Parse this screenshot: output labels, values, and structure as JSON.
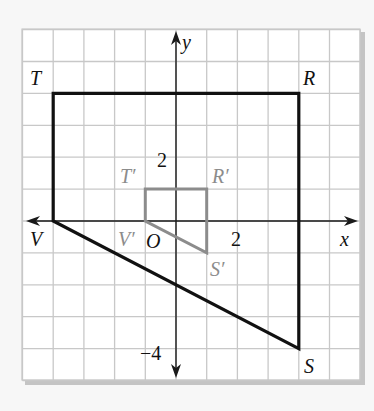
{
  "diagram": {
    "type": "coordinate-plane-dilation",
    "grid": {
      "x_min": -5,
      "x_max": 6,
      "y_min": -5,
      "y_max": 6,
      "origin_px": [
        176,
        221
      ],
      "cell_w": 30.7,
      "cell_h": 31.9,
      "line_color": "#c8c8c8",
      "paper_color": "#ffffff",
      "shadow_color": "#bdbdbd"
    },
    "axes": {
      "x_label": "x",
      "y_label": "y",
      "origin_label": "O",
      "tick_labels": {
        "x_2": "2",
        "y_2": "2",
        "y_neg4": "−4"
      },
      "color": "#1a1a1a"
    },
    "original_figure": {
      "color": "#111111",
      "vertices": [
        {
          "name": "T",
          "x": -4,
          "y": 4
        },
        {
          "name": "R",
          "x": 4,
          "y": 4
        },
        {
          "name": "S",
          "x": 4,
          "y": -4
        },
        {
          "name": "V",
          "x": -4,
          "y": 0
        }
      ]
    },
    "image_figure": {
      "color": "#8c8c8c",
      "vertices": [
        {
          "name": "T′",
          "x": -1,
          "y": 1
        },
        {
          "name": "R′",
          "x": 1,
          "y": 1
        },
        {
          "name": "S′",
          "x": 1,
          "y": -1
        },
        {
          "name": "V′",
          "x": -1,
          "y": 0
        }
      ]
    },
    "labels": {
      "T": "T",
      "R": "R",
      "S": "S",
      "V": "V",
      "T_prime": "T′",
      "R_prime": "R′",
      "S_prime": "S′",
      "V_prime": "V′"
    }
  }
}
